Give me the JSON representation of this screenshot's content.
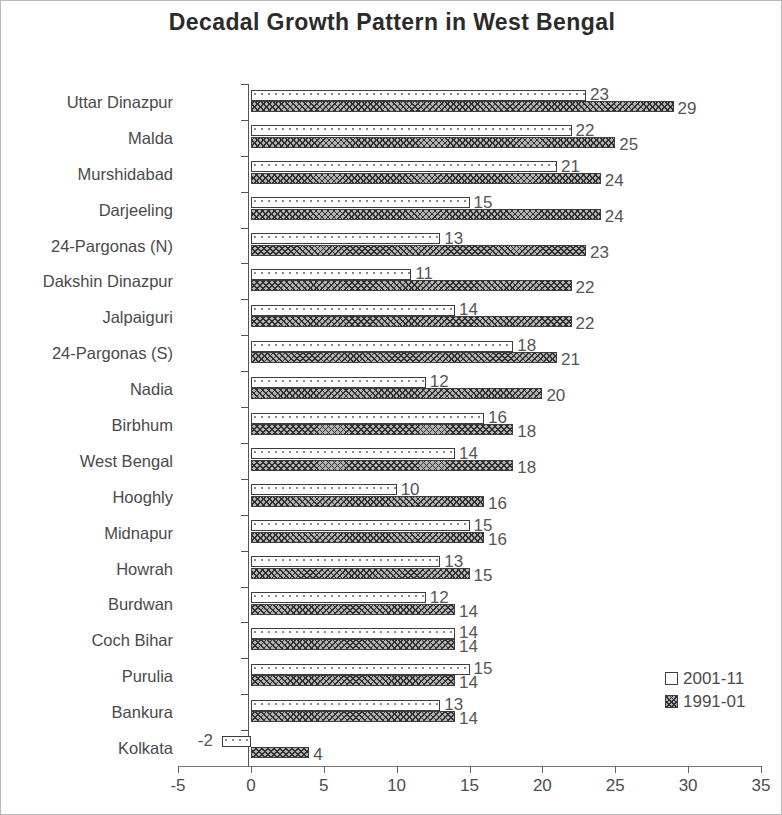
{
  "chart_data": {
    "type": "bar",
    "orientation": "horizontal",
    "title": "Decadal Growth Pattern in West Bengal",
    "xlabel": "",
    "ylabel": "",
    "xlim": [
      -5,
      35
    ],
    "xticks": [
      "-5",
      "0",
      "5",
      "10",
      "15",
      "20",
      "25",
      "30",
      "35"
    ],
    "xtick_values": [
      -5,
      0,
      5,
      10,
      15,
      20,
      25,
      30,
      35
    ],
    "grid": false,
    "legend_position": "bottom-right",
    "categories": [
      "Uttar Dinazpur",
      "Malda",
      "Murshidabad",
      "Darjeeling",
      "24-Pargonas (N)",
      "Dakshin Dinazpur",
      "Jalpaiguri",
      "24-Pargonas (S)",
      "Nadia",
      "Birbhum",
      "West Bengal",
      "Hooghly",
      "Midnapur",
      "Howrah",
      "Burdwan",
      "Coch Bihar",
      "Purulia",
      "Bankura",
      "Kolkata"
    ],
    "series": [
      {
        "name": "2001-11",
        "values": [
          23,
          22,
          21,
          15,
          13,
          11,
          14,
          18,
          12,
          16,
          14,
          10,
          15,
          13,
          12,
          14,
          15,
          13,
          -2
        ]
      },
      {
        "name": "1991-01",
        "values": [
          29,
          25,
          24,
          24,
          23,
          22,
          22,
          21,
          20,
          18,
          18,
          16,
          16,
          15,
          14,
          14,
          14,
          14,
          4
        ]
      }
    ]
  },
  "legend": {
    "items": [
      {
        "label": "2001-11",
        "swatch": "open-square-swatch"
      },
      {
        "label": "1991-01",
        "swatch": "hatched-square-swatch"
      }
    ]
  }
}
